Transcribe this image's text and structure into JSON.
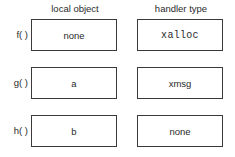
{
  "headers": {
    "local_object": "local object",
    "handler_type": "handler type"
  },
  "rows": [
    {
      "function": "f( )",
      "local_object": "none",
      "handler_type": "xalloc",
      "handler_mono": true
    },
    {
      "function": "g( )",
      "local_object": "a",
      "handler_type": "xmsg",
      "handler_mono": false
    },
    {
      "function": "h( )",
      "local_object": "b",
      "handler_type": "none",
      "handler_mono": false
    }
  ]
}
